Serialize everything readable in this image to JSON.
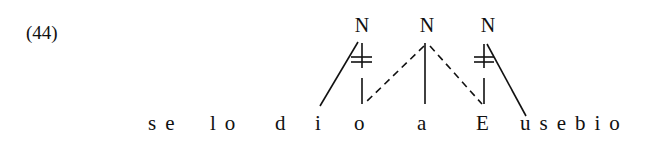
{
  "example": {
    "number": "(44)"
  },
  "nodes": [
    {
      "id": "N1",
      "label": "N",
      "x": 362
    },
    {
      "id": "N2",
      "label": "N",
      "x": 427
    },
    {
      "id": "N3",
      "label": "N",
      "x": 488
    }
  ],
  "sentence": {
    "segments": [
      {
        "text": "se",
        "x": 148
      },
      {
        "text": "lo",
        "x": 210
      },
      {
        "text": "d",
        "x": 275
      },
      {
        "text": "i",
        "x": 315
      },
      {
        "text": "o",
        "x": 354
      },
      {
        "text": "a",
        "x": 417
      },
      {
        "text": "E",
        "x": 476
      },
      {
        "text": "usebio",
        "x": 520
      }
    ]
  },
  "links": [
    {
      "from": "N1",
      "to": "i",
      "style": "solid"
    },
    {
      "from": "N1",
      "to": "o",
      "style": "solid",
      "delinked": true
    },
    {
      "from": "N2",
      "to": "o",
      "style": "dashed"
    },
    {
      "from": "N2",
      "to": "a",
      "style": "solid"
    },
    {
      "from": "N2",
      "to": "E",
      "style": "dashed"
    },
    {
      "from": "N3",
      "to": "E",
      "style": "solid",
      "delinked": true
    },
    {
      "from": "N3",
      "to": "u",
      "style": "solid"
    }
  ]
}
